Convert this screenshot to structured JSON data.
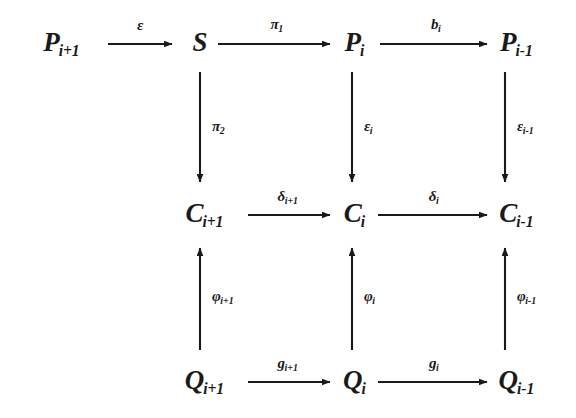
{
  "diagram": {
    "type": "commutative-diagram",
    "title": "",
    "background_color": "#ffffff",
    "ink_color": "#1a1a1a",
    "rows": 3,
    "columns": 4,
    "nodes": [
      {
        "id": "P_ip1",
        "base": "P",
        "sub": "i+1",
        "row": 0,
        "col": 0,
        "x": 62,
        "y": 42
      },
      {
        "id": "S",
        "base": "S",
        "sub": "",
        "row": 0,
        "col": 1,
        "x": 200,
        "y": 42
      },
      {
        "id": "P_i",
        "base": "P",
        "sub": "i",
        "row": 0,
        "col": 2,
        "x": 355,
        "y": 42
      },
      {
        "id": "P_im1",
        "base": "P",
        "sub": "i-1",
        "row": 0,
        "col": 3,
        "x": 517,
        "y": 42
      },
      {
        "id": "C_ip1",
        "base": "C",
        "sub": "i+1",
        "row": 1,
        "col": 1,
        "x": 205,
        "y": 213
      },
      {
        "id": "C_i",
        "base": "C",
        "sub": "i",
        "row": 1,
        "col": 2,
        "x": 355,
        "y": 213
      },
      {
        "id": "C_im1",
        "base": "C",
        "sub": "i-1",
        "row": 1,
        "col": 3,
        "x": 517,
        "y": 213
      },
      {
        "id": "Q_ip1",
        "base": "Q",
        "sub": "i+1",
        "row": 2,
        "col": 1,
        "x": 205,
        "y": 380
      },
      {
        "id": "Q_i",
        "base": "Q",
        "sub": "i",
        "row": 2,
        "col": 2,
        "x": 355,
        "y": 380
      },
      {
        "id": "Q_im1",
        "base": "Q",
        "sub": "i-1",
        "row": 2,
        "col": 3,
        "x": 517,
        "y": 380
      }
    ],
    "edges": [
      {
        "id": "e1",
        "from": "P_ip1",
        "to": "S",
        "direction": "right",
        "label_base": "ε",
        "label_sub": "",
        "x1": 108,
        "y1": 44,
        "x2": 172,
        "y2": 44,
        "lx": 140,
        "ly": 25
      },
      {
        "id": "e2",
        "from": "S",
        "to": "P_i",
        "direction": "right",
        "label_base": "π",
        "label_sub": "1",
        "x1": 218,
        "y1": 44,
        "x2": 330,
        "y2": 44,
        "lx": 277,
        "ly": 24
      },
      {
        "id": "e3",
        "from": "P_i",
        "to": "P_im1",
        "direction": "right",
        "label_base": "b",
        "label_sub": "i",
        "x1": 380,
        "y1": 44,
        "x2": 487,
        "y2": 44,
        "lx": 436,
        "ly": 24
      },
      {
        "id": "e4",
        "from": "S",
        "to": "C_ip1",
        "direction": "down",
        "label_base": "π",
        "label_sub": "2",
        "x1": 200,
        "y1": 72,
        "x2": 200,
        "y2": 182,
        "lx": 212,
        "ly": 126
      },
      {
        "id": "e5",
        "from": "P_i",
        "to": "C_i",
        "direction": "down",
        "label_base": "ε",
        "label_sub": "i",
        "x1": 352,
        "y1": 72,
        "x2": 352,
        "y2": 182,
        "lx": 364,
        "ly": 126
      },
      {
        "id": "e6",
        "from": "P_im1",
        "to": "C_im1",
        "direction": "down",
        "label_base": "ε",
        "label_sub": "i-1",
        "x1": 505,
        "y1": 72,
        "x2": 505,
        "y2": 182,
        "lx": 517,
        "ly": 126
      },
      {
        "id": "e7",
        "from": "C_ip1",
        "to": "C_i",
        "direction": "right",
        "label_base": "δ",
        "label_sub": "i+1",
        "x1": 248,
        "y1": 215,
        "x2": 330,
        "y2": 215,
        "lx": 288,
        "ly": 196
      },
      {
        "id": "e8",
        "from": "C_i",
        "to": "C_im1",
        "direction": "right",
        "label_base": "δ",
        "label_sub": "i",
        "x1": 378,
        "y1": 215,
        "x2": 487,
        "y2": 215,
        "lx": 434,
        "ly": 196
      },
      {
        "id": "e9",
        "from": "Q_ip1",
        "to": "C_ip1",
        "direction": "up",
        "label_base": "φ",
        "label_sub": "i+1",
        "x1": 200,
        "y1": 350,
        "x2": 200,
        "y2": 248,
        "lx": 212,
        "ly": 296
      },
      {
        "id": "e10",
        "from": "Q_i",
        "to": "C_i",
        "direction": "up",
        "label_base": "φ",
        "label_sub": "i",
        "x1": 352,
        "y1": 350,
        "x2": 352,
        "y2": 248,
        "lx": 364,
        "ly": 296
      },
      {
        "id": "e11",
        "from": "Q_im1",
        "to": "C_im1",
        "direction": "up",
        "label_base": "φ",
        "label_sub": "i-1",
        "x1": 505,
        "y1": 350,
        "x2": 505,
        "y2": 248,
        "lx": 517,
        "ly": 296
      },
      {
        "id": "e12",
        "from": "Q_ip1",
        "to": "Q_i",
        "direction": "right",
        "label_base": "g",
        "label_sub": "i+1",
        "x1": 248,
        "y1": 382,
        "x2": 330,
        "y2": 382,
        "lx": 288,
        "ly": 363
      },
      {
        "id": "e13",
        "from": "Q_i",
        "to": "Q_im1",
        "direction": "right",
        "label_base": "g",
        "label_sub": "i",
        "x1": 378,
        "y1": 382,
        "x2": 487,
        "y2": 382,
        "lx": 434,
        "ly": 363
      }
    ]
  }
}
